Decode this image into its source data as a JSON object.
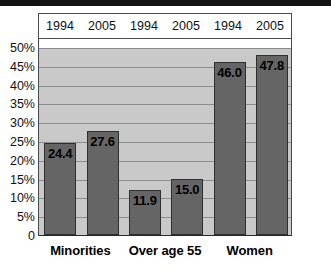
{
  "chart_data": {
    "type": "bar",
    "title": "",
    "xlabel": "",
    "ylabel": "",
    "ylim": [
      0,
      50
    ],
    "grid": true,
    "legend_position": "top-header-row",
    "categories": [
      "Minorities",
      "Over age 55",
      "Women"
    ],
    "column_headers": [
      "1994",
      "2005",
      "1994",
      "2005",
      "1994",
      "2005"
    ],
    "ytick_labels": [
      "50%",
      "45%",
      "40%",
      "35%",
      "30%",
      "25%",
      "20%",
      "15%",
      "10%",
      "5%",
      "0"
    ],
    "ytick_values": [
      50,
      45,
      40,
      35,
      30,
      25,
      20,
      15,
      10,
      5,
      0
    ],
    "series": [
      {
        "name": "1994",
        "values": [
          24.4,
          11.9,
          46.0
        ]
      },
      {
        "name": "2005",
        "values": [
          27.6,
          15.0,
          47.8
        ]
      }
    ],
    "bars": [
      {
        "group": "Minorities",
        "year": "1994",
        "value": 24.4,
        "label": "24.4"
      },
      {
        "group": "Minorities",
        "year": "2005",
        "value": 27.6,
        "label": "27.6"
      },
      {
        "group": "Over age 55",
        "year": "1994",
        "value": 11.9,
        "label": "11.9"
      },
      {
        "group": "Over age 55",
        "year": "2005",
        "value": 15.0,
        "label": "15.0"
      },
      {
        "group": "Women",
        "year": "1994",
        "value": 46.0,
        "label": "46.0"
      },
      {
        "group": "Women",
        "year": "2005",
        "value": 47.8,
        "label": "47.8"
      }
    ],
    "colors": {
      "bar_fill": "#656565",
      "bar_stroke": "#2f2f2f",
      "plot_background": "#c9c9c9",
      "gridline": "#8d8d8d",
      "axis": "#4a4a4a",
      "text": "#101010"
    }
  }
}
